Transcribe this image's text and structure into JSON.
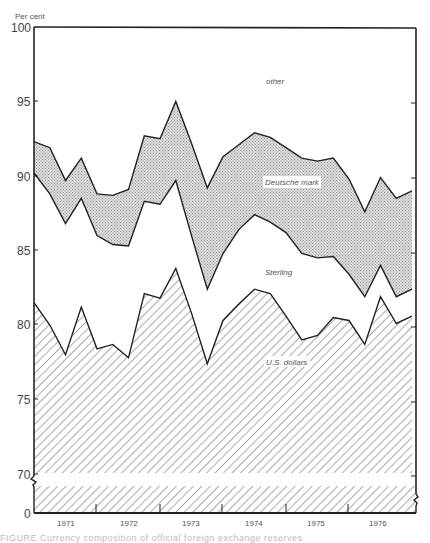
{
  "chart_data": {
    "type": "area",
    "stacked": true,
    "title": "",
    "ylabel": "Per cent",
    "xlabel": "",
    "ylim": [
      0,
      100
    ],
    "y_axis_break": {
      "from": 0,
      "to": 68
    },
    "y_ticks": [
      0,
      70,
      75,
      80,
      85,
      90,
      95,
      100
    ],
    "x_tick_labels": [
      "1971",
      "1972",
      "1973",
      "1974",
      "1975",
      "1976"
    ],
    "x_period": "quarterly",
    "x": [
      "1970Q3",
      "1970Q4",
      "1971Q1",
      "1971Q2",
      "1971Q3",
      "1971Q4",
      "1972Q1",
      "1972Q2",
      "1972Q3",
      "1972Q4",
      "1973Q1",
      "1973Q2",
      "1973Q3",
      "1973Q4",
      "1974Q1",
      "1974Q2",
      "1974Q3",
      "1974Q4",
      "1975Q1",
      "1975Q2",
      "1975Q3",
      "1975Q4",
      "1976Q1",
      "1976Q2",
      "1976Q3"
    ],
    "series": [
      {
        "name": "U.S. dollars",
        "fill": "diagonal-hatch",
        "cumulative_values": [
          81.5,
          80.0,
          78.0,
          81.2,
          78.4,
          78.7,
          77.8,
          82.1,
          81.8,
          83.8,
          80.8,
          77.4,
          80.3,
          81.4,
          82.4,
          82.1,
          80.6,
          79.0,
          79.3,
          80.5,
          80.3,
          78.7,
          81.9,
          80.1,
          80.6
        ]
      },
      {
        "name": "Sterling",
        "fill": "white",
        "cumulative_values": [
          90.2,
          88.8,
          86.8,
          88.5,
          86.0,
          85.4,
          85.3,
          88.3,
          88.1,
          89.7,
          86.0,
          82.4,
          84.8,
          86.4,
          87.4,
          86.9,
          86.2,
          84.8,
          84.5,
          84.6,
          83.4,
          81.9,
          84.0,
          81.9,
          82.4
        ]
      },
      {
        "name": "Deutsche mark",
        "fill": "stipple-grey",
        "cumulative_values": [
          92.3,
          91.9,
          89.7,
          91.2,
          88.8,
          88.7,
          89.1,
          92.7,
          92.5,
          95.0,
          92.2,
          89.2,
          91.3,
          92.1,
          92.9,
          92.6,
          91.9,
          91.2,
          91.0,
          91.2,
          89.8,
          87.6,
          89.9,
          88.5,
          89.0
        ]
      },
      {
        "name": "other",
        "fill": "white",
        "cumulative_values": [
          100,
          100,
          100,
          100,
          100,
          100,
          100,
          100,
          100,
          100,
          100,
          100,
          100,
          100,
          100,
          100,
          100,
          100,
          100,
          100,
          100,
          100,
          100,
          100,
          100
        ]
      }
    ],
    "legend": "inline labels",
    "grid": false
  },
  "labels": {
    "unit": "Per cent",
    "other": "other",
    "deutsche_mark": "Deutsche mark",
    "sterling": "Sterling",
    "us_dollars": "U.S. dollars",
    "y100": "100",
    "y95": "95",
    "y90": "90",
    "y85": "85",
    "y80": "80",
    "y75": "75",
    "y70": "70",
    "y0": "0",
    "x1971": "1971",
    "x1972": "1972",
    "x1973": "1973",
    "x1974": "1974",
    "x1975": "1975",
    "x1976": "1976"
  },
  "caption": "FIGURE  Currency composition of official foreign exchange reserves"
}
